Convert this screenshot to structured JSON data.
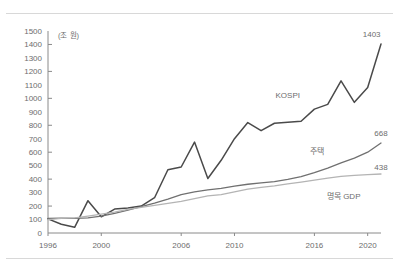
{
  "figure": {
    "title": "",
    "unit_label": "(조 원)"
  },
  "chart_data": {
    "type": "line",
    "title": "",
    "xlabel": "",
    "ylabel": "",
    "unit": "조 원",
    "xlim": [
      1996,
      2021
    ],
    "ylim": [
      0,
      1500
    ],
    "ytick_step": 100,
    "ytick_major_step": 200,
    "grid": false,
    "legend": "inline-annotations",
    "ytick_labels": [
      0,
      100,
      200,
      300,
      400,
      500,
      600,
      700,
      800,
      900,
      1000,
      1100,
      1200,
      1300,
      1400,
      1500
    ],
    "xtick_labels": [
      1996,
      2000,
      2006,
      2010,
      2016,
      2020
    ],
    "x": [
      1996,
      1997,
      1998,
      1999,
      2000,
      2001,
      2002,
      2003,
      2004,
      2005,
      2006,
      2007,
      2008,
      2009,
      2010,
      2011,
      2012,
      2013,
      2014,
      2015,
      2016,
      2017,
      2018,
      2019,
      2020,
      2021
    ],
    "series": [
      {
        "name": "KOSPI",
        "label": "KOSPI",
        "color": "#4a4a4a",
        "width": 1.5,
        "end_value_label": "1403",
        "values": [
          105,
          65,
          42,
          240,
          120,
          178,
          186,
          200,
          262,
          470,
          490,
          675,
          405,
          540,
          700,
          820,
          760,
          815,
          822,
          830,
          920,
          955,
          1130,
          970,
          1080,
          1403
        ]
      },
      {
        "name": "housing",
        "label": "주택",
        "color": "#707070",
        "width": 1.3,
        "end_value_label": "668",
        "values": [
          108,
          110,
          108,
          112,
          125,
          145,
          170,
          195,
          222,
          252,
          285,
          305,
          320,
          332,
          348,
          362,
          372,
          382,
          398,
          418,
          448,
          482,
          520,
          556,
          600,
          668
        ]
      },
      {
        "name": "nominal-gdp",
        "label": "명목 GDP",
        "color": "#b4b4b4",
        "width": 1.3,
        "end_value_label": "438",
        "values": [
          100,
          108,
          112,
          125,
          140,
          155,
          175,
          190,
          205,
          220,
          235,
          255,
          275,
          285,
          305,
          325,
          338,
          350,
          365,
          378,
          392,
          408,
          420,
          428,
          434,
          438
        ]
      }
    ],
    "annotations": [
      {
        "name": "kospi-series-label",
        "text": "KOSPI",
        "x": 2014.0,
        "y": 1000
      },
      {
        "name": "housing-series-label",
        "text": "주택",
        "x": 2016.2,
        "y": 590
      },
      {
        "name": "gdp-series-label",
        "text": "명목 GDP",
        "x": 2018.2,
        "y": 250
      },
      {
        "name": "kospi-end-label",
        "text": "1403",
        "x": 2020.3,
        "y": 1452
      },
      {
        "name": "housing-end-label",
        "text": "668",
        "x": 2021.0,
        "y": 720
      },
      {
        "name": "gdp-end-label",
        "text": "438",
        "x": 2021.0,
        "y": 470
      }
    ]
  }
}
